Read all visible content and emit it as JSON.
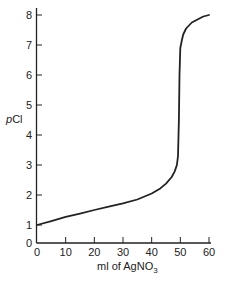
{
  "chart_data": {
    "type": "line",
    "title": "",
    "xlabel": "ml of AgNO3",
    "xlabel_parts": {
      "main": "ml of AgNO",
      "sub": "3"
    },
    "ylabel": "pCl",
    "ylabel_parts": {
      "italic": "p",
      "rest": "Cl"
    },
    "xlim": [
      0,
      60
    ],
    "ylim": [
      0,
      8
    ],
    "grid": false,
    "legend": null,
    "x_ticks": [
      0,
      10,
      20,
      30,
      40,
      50,
      60
    ],
    "y_ticks": [
      0,
      1,
      2,
      3,
      4,
      5,
      6,
      7,
      8
    ],
    "series": [
      {
        "name": "titration curve",
        "color": "#222222",
        "x": [
          0,
          5,
          10,
          15,
          20,
          25,
          30,
          35,
          40,
          43,
          45,
          47,
          48,
          48.8,
          49.2,
          49.5,
          49.7,
          50,
          50.5,
          51,
          52,
          54,
          56,
          58,
          60
        ],
        "y": [
          1.0,
          1.13,
          1.27,
          1.38,
          1.5,
          1.61,
          1.72,
          1.85,
          2.05,
          2.22,
          2.38,
          2.6,
          2.78,
          3.0,
          3.3,
          4.5,
          6.0,
          6.9,
          7.15,
          7.35,
          7.55,
          7.75,
          7.85,
          7.95,
          8.0
        ]
      }
    ]
  }
}
